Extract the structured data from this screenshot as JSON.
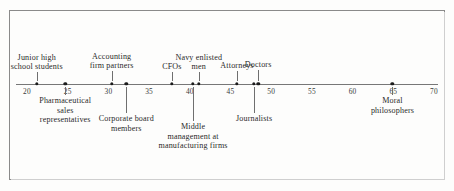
{
  "figure": {
    "title": "",
    "axis": {
      "ticks": [
        {
          "value": 20,
          "label": "20",
          "x": 27
        },
        {
          "value": 25,
          "label": "25",
          "x": 108
        },
        {
          "value": 30,
          "label": "30",
          "x": 190
        },
        {
          "value": 35,
          "label": "35",
          "x": 271
        },
        {
          "value": 40,
          "label": "40",
          "x": 353
        },
        {
          "value": 45,
          "label": "45",
          "x": 434
        },
        {
          "value": 50,
          "label": "50",
          "x": 516
        },
        {
          "value": 55,
          "label": "55",
          "x": 597
        },
        {
          "value": 60,
          "label": "60",
          "x": 679
        },
        {
          "value": 65,
          "label": "65",
          "x": 760
        },
        {
          "value": 70,
          "label": "70",
          "x": 842
        }
      ]
    },
    "markers": [
      {
        "label": "Junior high\nschool students",
        "value": 21.2,
        "side": "above",
        "lines": [
          "Junior high",
          "school students"
        ]
      },
      {
        "label": "Pharmaceutical\nsales\nrepresentatives",
        "value": 24.7,
        "side": "below",
        "lines": [
          "Pharmaceutical",
          "sales",
          "representatives"
        ]
      },
      {
        "label": "Accounting\nfirm partners",
        "value": 30.4,
        "side": "above",
        "lines": [
          "Accounting",
          "firm partners"
        ]
      },
      {
        "label": "Corporate board\nmembers",
        "value": 32.2,
        "side": "below",
        "lines": [
          "Corporate board",
          "members"
        ]
      },
      {
        "label": "CFOs",
        "value": 37.8,
        "side": "above",
        "lines": [
          "CFOs"
        ]
      },
      {
        "label": "Middle\nmanagement at\nmanufacturing firms",
        "value": 40.4,
        "side": "below",
        "lines": [
          "Middle",
          "management at",
          "manufacturing firms"
        ]
      },
      {
        "label": "Navy enlisted\nmen",
        "value": 41.1,
        "side": "above",
        "lines": [
          "Navy enlisted",
          "men"
        ]
      },
      {
        "label": "Attorneys",
        "value": 45.8,
        "side": "above",
        "lines": [
          "Attorneys"
        ]
      },
      {
        "label": "Journalists",
        "value": 47.9,
        "side": "below",
        "lines": [
          "Journalists"
        ]
      },
      {
        "label": "Doctors",
        "value": 48.4,
        "side": "above",
        "lines": [
          "Doctors"
        ]
      },
      {
        "label": "Moral\nphilosophers",
        "value": 64.9,
        "side": "below",
        "lines": [
          "Moral",
          "philosophers"
        ]
      }
    ]
  },
  "chart_data": {
    "type": "scatter",
    "title": "",
    "subtitle": "",
    "xlabel": "",
    "ylabel": "",
    "xlim": [
      19,
      71
    ],
    "xticks": [
      20,
      25,
      30,
      35,
      40,
      45,
      50,
      55,
      60,
      65,
      70
    ],
    "xticklabels": [
      "20",
      "25",
      "30",
      "35",
      "40",
      "45",
      "50",
      "55",
      "60",
      "65",
      "70"
    ],
    "grid": false,
    "legend": "none",
    "orientation": "horizontal-number-line",
    "categories": [
      "Junior high school students",
      "Pharmaceutical sales representatives",
      "Accounting firm partners",
      "Corporate board members",
      "CFOs",
      "Middle management at manufacturing firms",
      "Navy enlisted men",
      "Attorneys",
      "Journalists",
      "Doctors",
      "Moral philosophers"
    ],
    "values": [
      21.2,
      24.7,
      30.4,
      32.2,
      37.8,
      40.4,
      41.1,
      45.8,
      47.9,
      48.4,
      64.9
    ],
    "annotations": [
      {
        "text": "Junior high school students",
        "value": 21.2,
        "position": "above"
      },
      {
        "text": "Pharmaceutical sales representatives",
        "value": 24.7,
        "position": "below"
      },
      {
        "text": "Accounting firm partners",
        "value": 30.4,
        "position": "above"
      },
      {
        "text": "Corporate board members",
        "value": 32.2,
        "position": "below"
      },
      {
        "text": "CFOs",
        "value": 37.8,
        "position": "above"
      },
      {
        "text": "Middle management at manufacturing firms",
        "value": 40.4,
        "position": "below"
      },
      {
        "text": "Navy enlisted men",
        "value": 41.1,
        "position": "above"
      },
      {
        "text": "Attorneys",
        "value": 45.8,
        "position": "above"
      },
      {
        "text": "Journalists",
        "value": 47.9,
        "position": "below"
      },
      {
        "text": "Doctors",
        "value": 48.4,
        "position": "above"
      },
      {
        "text": "Moral philosophers",
        "value": 64.9,
        "position": "below"
      }
    ],
    "colors": {
      "marker": "#1c1c1c",
      "axis": "#777777",
      "leader": "#6f6f6f",
      "text": "#2a2a2a",
      "frame": "#8a8a8a",
      "background": "#fdfdfc"
    }
  }
}
